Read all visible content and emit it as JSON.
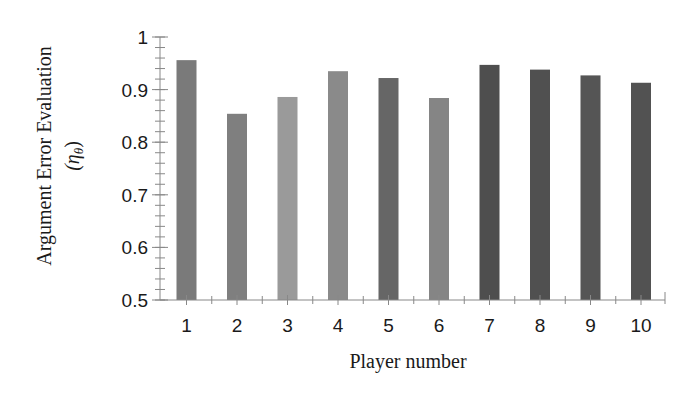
{
  "chart_data": {
    "type": "bar",
    "title": "",
    "xlabel": "Player number",
    "ylabel": "Argument Error Evaluation",
    "ylabel_symbol": "(η",
    "ylabel_symbol_sub": "θ",
    "ylabel_symbol_close": ")",
    "categories": [
      "1",
      "2",
      "3",
      "4",
      "5",
      "6",
      "7",
      "8",
      "9",
      "10"
    ],
    "values": [
      0.956,
      0.854,
      0.886,
      0.935,
      0.922,
      0.884,
      0.947,
      0.938,
      0.927,
      0.913
    ],
    "bar_colors": [
      "#7a7a7a",
      "#7f7f7f",
      "#9a9a9a",
      "#8a8a8a",
      "#666666",
      "#858585",
      "#4e4e4e",
      "#505050",
      "#555555",
      "#525252"
    ],
    "ylim": [
      0.5,
      1.0
    ],
    "yticks": [
      0.5,
      0.6,
      0.7,
      0.8,
      0.9,
      1
    ],
    "ytick_labels": [
      "0.5",
      "0.6",
      "0.7",
      "0.8",
      "0.9",
      "1"
    ],
    "y_minor_step": 0.02,
    "grid": false,
    "legend": null
  }
}
